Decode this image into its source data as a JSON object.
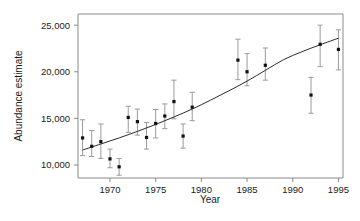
{
  "chart_data": {
    "type": "scatter",
    "title": "",
    "xlabel": "Year",
    "ylabel": "Abundance estimate",
    "xlim": [
      1966.5,
      1995.5
    ],
    "ylim": [
      8600,
      26200
    ],
    "grid": false,
    "legend": null,
    "xticks": [
      1970,
      1975,
      1980,
      1985,
      1990,
      1995
    ],
    "xtick_labels": [
      "1970",
      "1975",
      "1980",
      "1985",
      "1990",
      "1995"
    ],
    "yticks": [
      10000,
      15000,
      20000,
      25000
    ],
    "ytick_labels": [
      "10,000",
      "15,000",
      "20,000",
      "25,000"
    ],
    "marker_color": "#111111",
    "errorbar_color": "#9a9a9a",
    "line_color": "#2b2b2b",
    "x": [
      1967,
      1968,
      1969,
      1970,
      1971,
      1972,
      1973,
      1974,
      1975,
      1976,
      1977,
      1978,
      1979,
      1984,
      1985,
      1987,
      1992,
      1993,
      1995
    ],
    "values": [
      12900,
      12000,
      12500,
      10650,
      9800,
      15100,
      14650,
      12950,
      14450,
      15250,
      16800,
      13100,
      16200,
      21250,
      20000,
      20700,
      17500,
      22950,
      22400
    ],
    "y_lower": [
      11000,
      10900,
      10700,
      9700,
      8900,
      13500,
      13200,
      11700,
      12900,
      13900,
      14950,
      11800,
      14750,
      19150,
      18500,
      19100,
      15550,
      20550,
      20200
    ],
    "y_upper": [
      14850,
      13700,
      14400,
      11700,
      10700,
      16300,
      16000,
      14550,
      15950,
      16550,
      19100,
      14400,
      17800,
      23500,
      21950,
      22550,
      19400,
      25000,
      24500
    ],
    "fit_curve": {
      "description": "fitted exponential-like trend",
      "x": [
        1967,
        1969,
        1971,
        1973,
        1975,
        1977,
        1979,
        1981,
        1983,
        1985,
        1987,
        1989,
        1991,
        1993,
        1995
      ],
      "y": [
        11600,
        12250,
        12900,
        13600,
        14350,
        15150,
        16000,
        16950,
        17950,
        19000,
        20150,
        21300,
        22150,
        22900,
        23600
      ]
    }
  },
  "axes": {
    "y_title": "Abundance estimate",
    "x_title": "Year"
  }
}
